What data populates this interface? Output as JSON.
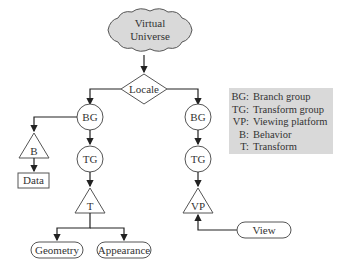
{
  "diagram": {
    "root": {
      "label_line1": "Virtual",
      "label_line2": "Universe",
      "fill": "#d9d9d9"
    },
    "locale": {
      "label": "Locale"
    },
    "left_branch": {
      "bg": {
        "label": "BG"
      },
      "tg": {
        "label": "TG"
      },
      "behavior": {
        "label": "B"
      },
      "data": {
        "label": "Data"
      },
      "transform": {
        "label": "T"
      },
      "geometry": {
        "label": "Geometry"
      },
      "appearance": {
        "label": "Appearance"
      }
    },
    "right_branch": {
      "bg": {
        "label": "BG"
      },
      "tg": {
        "label": "TG"
      },
      "vp": {
        "label": "VP"
      },
      "view": {
        "label": "View"
      }
    }
  },
  "legend": {
    "background": "#d9d9d9",
    "items": [
      {
        "key": "BG:",
        "value": "Branch group"
      },
      {
        "key": "TG:",
        "value": "Transform group"
      },
      {
        "key": "VP:",
        "value": "Viewing platform"
      },
      {
        "key": "B:",
        "value": "Behavior"
      },
      {
        "key": "T:",
        "value": "Transform"
      }
    ]
  }
}
